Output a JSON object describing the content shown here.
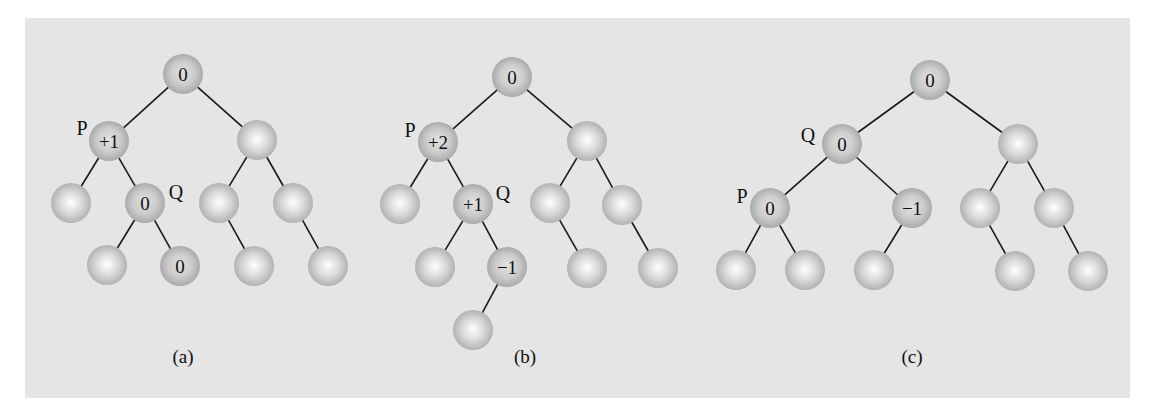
{
  "figure": {
    "background": "#e5e5e5",
    "edge_color": "#1a1a1a",
    "sphere_plain": {
      "center": "#ffffff",
      "mid": "#d6d6d6",
      "edge": "#b0b0b0"
    },
    "sphere_labeled": {
      "center": "#e0e0e0",
      "mid": "#c9c9c9",
      "edge": "#a9a9a9"
    },
    "node_radius": 20
  },
  "trees": [
    {
      "id": "a",
      "caption": "(a)",
      "caption_pos": [
        183,
        357
      ],
      "nodes": [
        {
          "id": "a0",
          "x": 183,
          "y": 74,
          "label": "0"
        },
        {
          "id": "a1",
          "x": 109,
          "y": 141,
          "label": "+1",
          "tag": "P",
          "tag_pos": [
            82,
            128
          ]
        },
        {
          "id": "a2",
          "x": 257,
          "y": 140,
          "label": ""
        },
        {
          "id": "a3",
          "x": 71,
          "y": 203,
          "label": ""
        },
        {
          "id": "a4",
          "x": 145,
          "y": 203,
          "label": "0",
          "tag": "Q",
          "tag_pos": [
            176,
            192
          ]
        },
        {
          "id": "a5",
          "x": 219,
          "y": 203,
          "label": ""
        },
        {
          "id": "a6",
          "x": 293,
          "y": 203,
          "label": ""
        },
        {
          "id": "a7",
          "x": 107,
          "y": 265,
          "label": ""
        },
        {
          "id": "a8",
          "x": 180,
          "y": 266,
          "label": "0"
        },
        {
          "id": "a9",
          "x": 254,
          "y": 266,
          "label": ""
        },
        {
          "id": "a10",
          "x": 328,
          "y": 266,
          "label": ""
        }
      ],
      "edges": [
        [
          "a0",
          "a1"
        ],
        [
          "a0",
          "a2"
        ],
        [
          "a1",
          "a3"
        ],
        [
          "a1",
          "a4"
        ],
        [
          "a2",
          "a5"
        ],
        [
          "a2",
          "a6"
        ],
        [
          "a4",
          "a7"
        ],
        [
          "a4",
          "a8"
        ],
        [
          "a5",
          "a9"
        ],
        [
          "a6",
          "a10"
        ]
      ]
    },
    {
      "id": "b",
      "caption": "(b)",
      "caption_pos": [
        525,
        357
      ],
      "nodes": [
        {
          "id": "b0",
          "x": 512,
          "y": 77,
          "label": "0"
        },
        {
          "id": "b1",
          "x": 438,
          "y": 142,
          "label": "+2",
          "tag": "P",
          "tag_pos": [
            410,
            130
          ]
        },
        {
          "id": "b2",
          "x": 587,
          "y": 141,
          "label": ""
        },
        {
          "id": "b3",
          "x": 400,
          "y": 204,
          "label": ""
        },
        {
          "id": "b4",
          "x": 473,
          "y": 204,
          "label": "+1",
          "tag": "Q",
          "tag_pos": [
            503,
            193
          ]
        },
        {
          "id": "b5",
          "x": 550,
          "y": 203,
          "label": ""
        },
        {
          "id": "b6",
          "x": 622,
          "y": 205,
          "label": ""
        },
        {
          "id": "b7",
          "x": 435,
          "y": 267,
          "label": ""
        },
        {
          "id": "b8",
          "x": 507,
          "y": 267,
          "label": "−1"
        },
        {
          "id": "b9",
          "x": 587,
          "y": 268,
          "label": ""
        },
        {
          "id": "b10",
          "x": 658,
          "y": 268,
          "label": ""
        },
        {
          "id": "b11",
          "x": 473,
          "y": 330,
          "label": ""
        }
      ],
      "edges": [
        [
          "b0",
          "b1"
        ],
        [
          "b0",
          "b2"
        ],
        [
          "b1",
          "b3"
        ],
        [
          "b1",
          "b4"
        ],
        [
          "b2",
          "b5"
        ],
        [
          "b2",
          "b6"
        ],
        [
          "b4",
          "b7"
        ],
        [
          "b4",
          "b8"
        ],
        [
          "b5",
          "b9"
        ],
        [
          "b6",
          "b10"
        ],
        [
          "b8",
          "b11"
        ]
      ]
    },
    {
      "id": "c",
      "caption": "(c)",
      "caption_pos": [
        912,
        357
      ],
      "nodes": [
        {
          "id": "c0",
          "x": 930,
          "y": 80,
          "label": "0"
        },
        {
          "id": "c1",
          "x": 842,
          "y": 144,
          "label": "0",
          "tag": "Q",
          "tag_pos": [
            808,
            135
          ]
        },
        {
          "id": "c2",
          "x": 1018,
          "y": 144,
          "label": ""
        },
        {
          "id": "c3",
          "x": 770,
          "y": 208,
          "label": "0",
          "tag": "P",
          "tag_pos": [
            742,
            196
          ]
        },
        {
          "id": "c4",
          "x": 912,
          "y": 208,
          "label": "−1"
        },
        {
          "id": "c5",
          "x": 980,
          "y": 208,
          "label": ""
        },
        {
          "id": "c6",
          "x": 1054,
          "y": 208,
          "label": ""
        },
        {
          "id": "c7",
          "x": 736,
          "y": 270,
          "label": ""
        },
        {
          "id": "c8",
          "x": 805,
          "y": 270,
          "label": ""
        },
        {
          "id": "c9",
          "x": 874,
          "y": 270,
          "label": ""
        },
        {
          "id": "c10",
          "x": 1015,
          "y": 271,
          "label": ""
        },
        {
          "id": "c11",
          "x": 1088,
          "y": 271,
          "label": ""
        }
      ],
      "edges": [
        [
          "c0",
          "c1"
        ],
        [
          "c0",
          "c2"
        ],
        [
          "c1",
          "c3"
        ],
        [
          "c1",
          "c4"
        ],
        [
          "c2",
          "c5"
        ],
        [
          "c2",
          "c6"
        ],
        [
          "c3",
          "c7"
        ],
        [
          "c3",
          "c8"
        ],
        [
          "c4",
          "c9"
        ],
        [
          "c5",
          "c10"
        ],
        [
          "c6",
          "c11"
        ]
      ]
    }
  ]
}
